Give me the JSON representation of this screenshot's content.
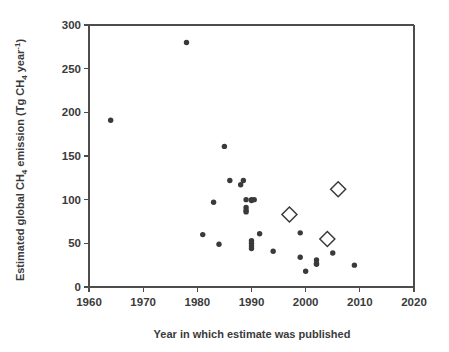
{
  "chart_data": {
    "type": "scatter",
    "title": "",
    "xlabel": "Year in which estimate was published",
    "ylabel": "Estimated global CH4 emission (Tg CH4 year-1)",
    "ylabel_parts": {
      "lead": "Estimated global CH",
      "sub1": "4",
      "mid": " emission (Tg CH",
      "sub2": "4",
      "tail": " year",
      "sup": "-1",
      "close": ")"
    },
    "xlim": [
      1960,
      2020
    ],
    "ylim": [
      0,
      300
    ],
    "xticks": [
      1960,
      1970,
      1980,
      1990,
      2000,
      2010,
      2020
    ],
    "yticks": [
      0,
      50,
      100,
      150,
      200,
      250,
      300
    ],
    "xtick_labels": [
      "1960",
      "1970",
      "1980",
      "1990",
      "2000",
      "2010",
      "2020"
    ],
    "ytick_labels": [
      "0",
      "50",
      "100",
      "150",
      "200",
      "250",
      "300"
    ],
    "grid": false,
    "legend": "none",
    "series": [
      {
        "name": "Published estimates",
        "marker": "filled-circle",
        "color": "#3a3a3a",
        "points": [
          {
            "x": 1964,
            "y": 191
          },
          {
            "x": 1978,
            "y": 280
          },
          {
            "x": 1981,
            "y": 60
          },
          {
            "x": 1983,
            "y": 97
          },
          {
            "x": 1984,
            "y": 49
          },
          {
            "x": 1985,
            "y": 161
          },
          {
            "x": 1986,
            "y": 122
          },
          {
            "x": 1988,
            "y": 117
          },
          {
            "x": 1988.5,
            "y": 122
          },
          {
            "x": 1989,
            "y": 100
          },
          {
            "x": 1989,
            "y": 91
          },
          {
            "x": 1989,
            "y": 88
          },
          {
            "x": 1989,
            "y": 86
          },
          {
            "x": 1990,
            "y": 100
          },
          {
            "x": 1990,
            "y": 99
          },
          {
            "x": 1990.5,
            "y": 100
          },
          {
            "x": 1990,
            "y": 53
          },
          {
            "x": 1990,
            "y": 50
          },
          {
            "x": 1990,
            "y": 47
          },
          {
            "x": 1990,
            "y": 44
          },
          {
            "x": 1991.5,
            "y": 61
          },
          {
            "x": 1994,
            "y": 41
          },
          {
            "x": 1999,
            "y": 34
          },
          {
            "x": 1999,
            "y": 62
          },
          {
            "x": 2000,
            "y": 18
          },
          {
            "x": 2002,
            "y": 31
          },
          {
            "x": 2002,
            "y": 27
          },
          {
            "x": 2002,
            "y": 26
          },
          {
            "x": 2004,
            "y": 55
          },
          {
            "x": 2005,
            "y": 39
          },
          {
            "x": 2009,
            "y": 25
          }
        ]
      },
      {
        "name": "Highlighted estimates",
        "marker": "open-diamond",
        "color": "#3a3a3a",
        "points": [
          {
            "x": 1997,
            "y": 83
          },
          {
            "x": 2004,
            "y": 55
          },
          {
            "x": 2006,
            "y": 112
          }
        ]
      }
    ]
  }
}
